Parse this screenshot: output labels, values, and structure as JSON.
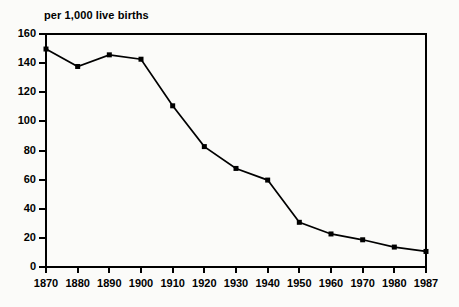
{
  "chart_data": {
    "type": "line",
    "title": "per 1,000 live births",
    "subtitle": "",
    "xlabel": "",
    "ylabel": "",
    "categories": [
      "1870",
      "1880",
      "1890",
      "1900",
      "1910",
      "1920",
      "1930",
      "1940",
      "1950",
      "1960",
      "1970",
      "1980",
      "1987"
    ],
    "values": [
      149,
      137,
      145,
      142,
      110,
      82,
      67,
      59,
      30,
      22,
      18,
      13,
      10
    ],
    "series": [
      {
        "name": "infant mortality rate",
        "values": [
          149,
          137,
          145,
          142,
          110,
          82,
          67,
          59,
          30,
          22,
          18,
          13,
          10
        ]
      }
    ],
    "yticks": [
      0,
      20,
      40,
      60,
      80,
      100,
      120,
      140,
      160
    ],
    "ytick_labels": [
      "0",
      "20",
      "40",
      "60",
      "80",
      "100",
      "120",
      "140",
      "160"
    ],
    "ylim": [
      0,
      160
    ],
    "xlim_categories": 13,
    "grid": false,
    "legend": false,
    "legend_position": "none",
    "marker": "square",
    "line_color": "#000000",
    "marker_color": "#000000",
    "background_color": "#fbfbf9",
    "axis_color": "#000000"
  }
}
